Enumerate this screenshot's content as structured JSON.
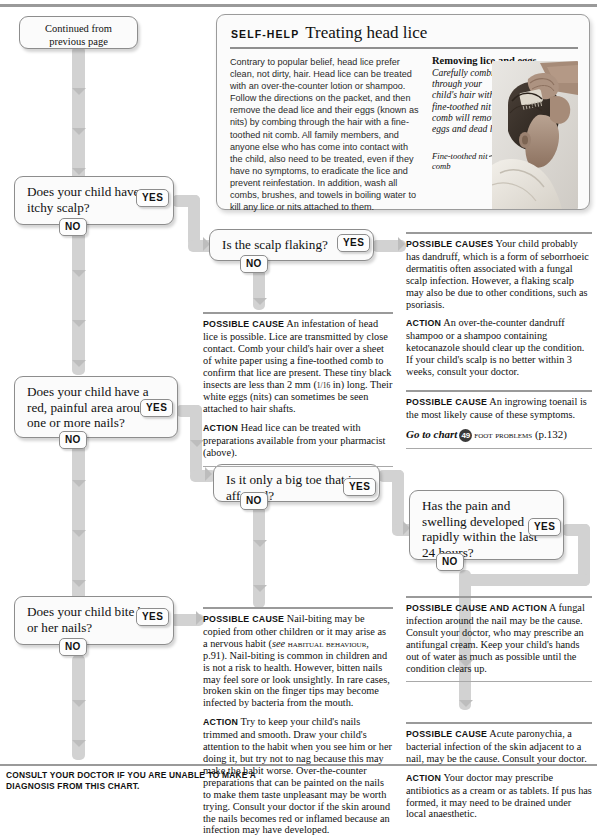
{
  "page": {
    "continued_label": "Continued from\nprevious page",
    "footer": "CONSULT YOUR DOCTOR IF YOU ARE UNABLE TO MAKE A DIAGNOSIS FROM THIS CHART."
  },
  "selfhelp": {
    "kicker": "SELF-HELP",
    "title": "Treating head lice",
    "body": "Contrary to popular belief, head lice prefer clean, not dirty, hair. Head lice can be treated with an over-the-counter lotion or shampoo. Follow the directions on the packet, and then remove the dead lice and their eggs (known as nits) by combing through the hair with a fine-toothed nit comb. All family members, and anyone else who has come into contact with the child, also need to be treated, even if they have no symptoms, to eradicate the lice and prevent reinfestation. In addition, wash all combs, brushes, and towels in boiling water to kill any lice or nits attached to them.",
    "figure_title": "Removing lice and eggs",
    "figure_caption": "Carefully combing through your child's hair with a fine-toothed nit comb will remove eggs and dead lice.",
    "figure_leader": "Fine-toothed nit comb"
  },
  "tags": {
    "yes": "YES",
    "no": "NO"
  },
  "questions": [
    {
      "id": "itchy-scalp",
      "text": "Does your child have an itchy scalp?"
    },
    {
      "id": "scalp-flaking",
      "text": "Is the scalp flaking?"
    },
    {
      "id": "red-painful-nails",
      "text": "Does your child have a red, painful area around one or more nails?"
    },
    {
      "id": "big-toe",
      "text": "Is it only a big toe that is affected?"
    },
    {
      "id": "pain-swelling-24h",
      "text": "Has the pain and swelling developed rapidly within the last 24 hours?"
    },
    {
      "id": "bites-nails",
      "text": "Does your child bite his or her nails?"
    }
  ],
  "labels": {
    "possible_cause": "POSSIBLE CAUSE",
    "possible_causes": "POSSIBLE CAUSES",
    "possible_cause_and_action": "POSSIBLE CAUSE AND ACTION",
    "action": "ACTION"
  },
  "blocks": {
    "dandruff": {
      "cause_label": "POSSIBLE CAUSES",
      "cause_text": "Your child probably has dandruff, which is a form of seborrhoeic dermatitis often associated with a fungal scalp infection. However, a flaking scalp may also be due to other conditions, such as psoriasis.",
      "action_label": "ACTION",
      "action_text": "An over-the-counter dandruff shampoo or a shampoo containing ketocanazole should clear up the condition. If your child's scalp is no better within 3 weeks, consult your doctor."
    },
    "headlice": {
      "cause_label": "POSSIBLE CAUSE",
      "cause_text_1": "An infestation of head lice is possible. Lice are transmitted by close contact. Comb your child's hair over a sheet of white paper using a fine-toothed comb to confirm that lice are present. These tiny black insects are less than 2 mm (",
      "cause_frac": "1/16",
      "cause_text_2": " in) long. Their white eggs (nits) can sometimes be seen attached to hair shafts.",
      "action_label": "ACTION",
      "action_text": "Head lice can be treated with preparations available from your pharmacist (above)."
    },
    "toenail": {
      "cause_label": "POSSIBLE CAUSE",
      "cause_text": "An ingrowing toenail is the most likely cause of these symptoms.",
      "goto_prefix": "Go to chart",
      "goto_number": "49",
      "goto_name": "FOOT PROBLEMS",
      "goto_page": "(p.132)"
    },
    "nailbiting": {
      "cause_label": "POSSIBLE CAUSE",
      "cause_text_1": "Nail-biting may be copied from other children or it may arise as a nervous habit (",
      "cause_see": "see",
      "cause_ref": "HABITUAL BEHAVIOUR",
      "cause_text_2": ", p.91). Nail-biting is common in children and is not a risk to health. However, bitten nails may feel sore or look unsightly. In rare cases, broken skin on the finger tips may become infected by bacteria from the mouth.",
      "action_label": "ACTION",
      "action_text": "Try to keep your child's nails trimmed and smooth. Draw your child's attention to the habit when you see him or her doing it, but try not to nag because this may make the habit worse. Over-the-counter preparations that can be painted on the nails to make them taste unpleasant may be worth trying. Consult your doctor if the skin around the nails becomes red or inflamed because an infection may have developed."
    },
    "fungal": {
      "cause_label": "POSSIBLE CAUSE AND ACTION",
      "cause_text": "A fungal infection around the nail may be the cause. Consult your doctor, who may prescribe an antifungal cream. Keep your child's hands out of water as much as possible until the condition clears up."
    },
    "paronychia": {
      "cause_label": "POSSIBLE CAUSE",
      "cause_text": "Acute paronychia, a bacterial infection of the skin adjacent to a nail, may be the cause. Consult your doctor.",
      "action_label": "ACTION",
      "action_text": "Your doctor may prescribe antibiotics as a cream or as tablets. If pus has formed, it may need to be drained under local anaesthetic."
    }
  },
  "colors": {
    "pipe": "#d2d2d2",
    "rule": "#9a9a9a",
    "box_border": "#8d8d8d",
    "box_fill": "#fbfbfb"
  }
}
